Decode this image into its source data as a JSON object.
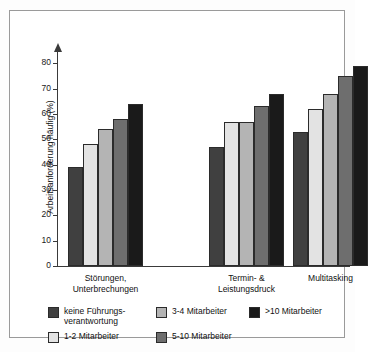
{
  "chart_data": {
    "type": "bar",
    "title": "",
    "xlabel": "",
    "ylabel": "Arbeitsanforderung häufig (%)",
    "ylim": [
      0,
      80
    ],
    "yticks": [
      0,
      10,
      20,
      30,
      40,
      50,
      60,
      70,
      80
    ],
    "ytick_labels": [
      "0",
      "10",
      "20",
      "30",
      "40",
      "50",
      "60",
      "70",
      "80"
    ],
    "grid": false,
    "legend_position": "bottom",
    "categories": [
      "Störungen,\nUnterbrechungen",
      "Termin- &\nLeistungsdruck",
      "Multitasking"
    ],
    "series": [
      {
        "name": "keine Führungs-\nverantwortung",
        "color": "#404040",
        "values": [
          39,
          47,
          53
        ]
      },
      {
        "name": "1-2 Mitarbeiter",
        "color": "#e3e3e3",
        "values": [
          48,
          57,
          62
        ]
      },
      {
        "name": "3-4 Mitarbeiter",
        "color": "#b4b4b4",
        "values": [
          54,
          57,
          68
        ]
      },
      {
        "name": "5-10 Mitarbeiter",
        "color": "#6e6e6e",
        "values": [
          58,
          63,
          75
        ]
      },
      {
        "name": ">10 Mitarbeiter",
        "color": "#1a1a1a",
        "values": [
          64,
          68,
          79
        ]
      }
    ]
  },
  "legend": {
    "items": [
      {
        "label": "keine Führungs-\nverantwortung",
        "color": "#404040"
      },
      {
        "label": "3-4 Mitarbeiter",
        "color": "#b4b4b4"
      },
      {
        "label": ">10 Mitarbeiter",
        "color": "#1a1a1a"
      },
      {
        "label": "1-2 Mitarbeiter",
        "color": "#e3e3e3"
      },
      {
        "label": "5-10 Mitarbeiter",
        "color": "#6e6e6e"
      }
    ]
  },
  "colors": {
    "axis": "#3a3a3a",
    "frame": "#9a9a9a",
    "text": "#111111",
    "background": "#ffffff"
  }
}
